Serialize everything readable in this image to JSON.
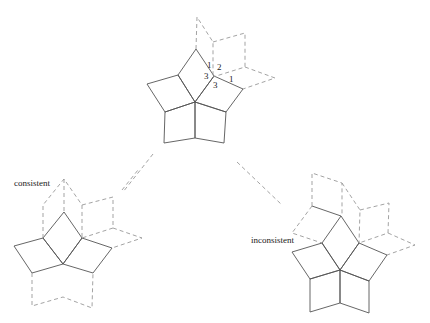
{
  "diagram": {
    "labels": {
      "consistent": "consistent",
      "inconsistent": "inconsistent"
    },
    "edge_numbers": {
      "n1_left": "1",
      "n2": "2",
      "n3_left": "3",
      "n3_bottom": "3",
      "n1_right": "1"
    },
    "colors": {
      "solid_line": "#555555",
      "dashed_line": "#999999",
      "background": "#ffffff"
    }
  }
}
